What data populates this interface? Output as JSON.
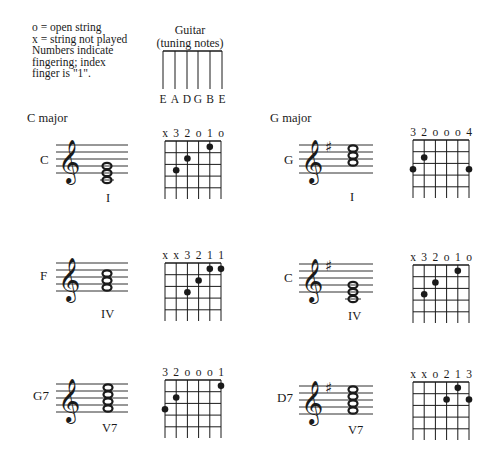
{
  "legend": {
    "lines": [
      "o = open string",
      "x = string not played",
      "Numbers indicate",
      "fingering; index",
      "finger is \"1\"."
    ]
  },
  "tuning": {
    "title": "Guitar",
    "subtitle": "(tuning notes)",
    "strings": [
      "E",
      "A",
      "D",
      "G",
      "B",
      "E"
    ]
  },
  "sections": [
    {
      "title": "C major"
    },
    {
      "title": "G major"
    }
  ],
  "chords": [
    {
      "name": "C",
      "roman": "I",
      "markers": [
        "x",
        "3",
        "2",
        "o",
        "1",
        "o"
      ],
      "dots": [
        {
          "string": 2,
          "fret": 3
        },
        {
          "string": 3,
          "fret": 2
        },
        {
          "string": 5,
          "fret": 1
        }
      ]
    },
    {
      "name": "F",
      "roman": "IV",
      "markers": [
        "x",
        "x",
        "3",
        "2",
        "1",
        "1"
      ],
      "dots": [
        {
          "string": 3,
          "fret": 3
        },
        {
          "string": 4,
          "fret": 2
        },
        {
          "string": 5,
          "fret": 1
        },
        {
          "string": 6,
          "fret": 1
        }
      ]
    },
    {
      "name": "G7",
      "roman": "V7",
      "markers": [
        "3",
        "2",
        "o",
        "o",
        "o",
        "1"
      ],
      "dots": [
        {
          "string": 1,
          "fret": 3
        },
        {
          "string": 2,
          "fret": 2
        },
        {
          "string": 6,
          "fret": 1
        }
      ]
    },
    {
      "name": "G",
      "roman": "I",
      "markers": [
        "3",
        "2",
        "o",
        "o",
        "o",
        "4"
      ],
      "dots": [
        {
          "string": 1,
          "fret": 3
        },
        {
          "string": 2,
          "fret": 2
        },
        {
          "string": 6,
          "fret": 3
        }
      ]
    },
    {
      "name": "C",
      "roman": "IV",
      "markers": [
        "x",
        "3",
        "2",
        "o",
        "1",
        "o"
      ],
      "dots": [
        {
          "string": 2,
          "fret": 3
        },
        {
          "string": 3,
          "fret": 2
        },
        {
          "string": 5,
          "fret": 1
        }
      ]
    },
    {
      "name": "D7",
      "roman": "V7",
      "markers": [
        "x",
        "x",
        "o",
        "2",
        "1",
        "3"
      ],
      "dots": [
        {
          "string": 4,
          "fret": 2
        },
        {
          "string": 5,
          "fret": 1
        },
        {
          "string": 6,
          "fret": 2
        }
      ]
    }
  ],
  "colors": {
    "ink": "#1a1a1a",
    "background": "#ffffff"
  }
}
